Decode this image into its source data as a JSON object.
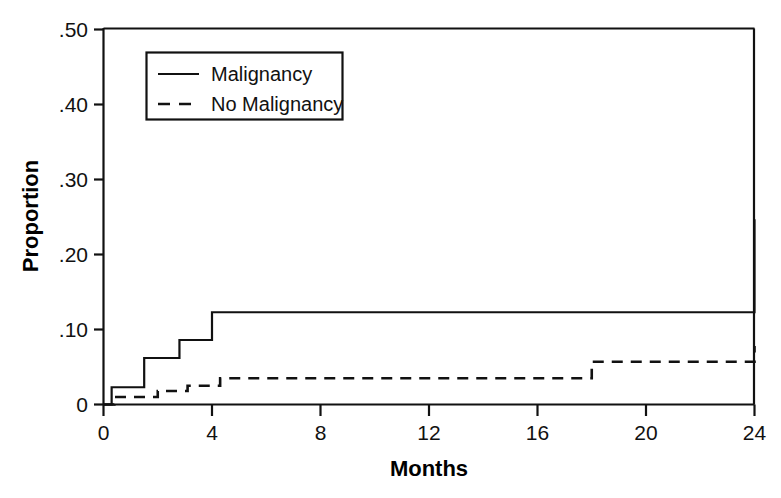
{
  "chart_data": {
    "type": "line",
    "title": "",
    "subtitle": "",
    "xlabel": "Months",
    "ylabel": "Proportion",
    "xlim": [
      0,
      24
    ],
    "ylim": [
      0,
      0.5
    ],
    "grid": false,
    "legend_position": "top-left-inside",
    "x_ticks": [
      0,
      4,
      8,
      12,
      16,
      20,
      24
    ],
    "x_tick_labels": [
      "0",
      "4",
      "8",
      "12",
      "16",
      "20",
      "24"
    ],
    "y_ticks": [
      0,
      0.1,
      0.2,
      0.3,
      0.4,
      0.5
    ],
    "y_tick_labels": [
      "0",
      ".10",
      ".20",
      ".30",
      ".40",
      ".50"
    ],
    "interpolation": "step-after",
    "series": [
      {
        "name": "Malignancy",
        "style": "solid",
        "color": "#111111",
        "x": [
          0,
          0.3,
          1.5,
          2.8,
          4.0,
          21.3,
          24
        ],
        "y": [
          0.0,
          0.023,
          0.062,
          0.086,
          0.123,
          0.123,
          0.247
        ]
      },
      {
        "name": "No Malignancy",
        "style": "dashed",
        "color": "#111111",
        "x": [
          0,
          0.4,
          2.0,
          3.1,
          4.3,
          13.5,
          18.0,
          24
        ],
        "y": [
          0.0,
          0.01,
          0.018,
          0.025,
          0.035,
          0.035,
          0.057,
          0.078
        ]
      }
    ],
    "annotations": []
  },
  "legend": {
    "entries": [
      {
        "label": "Malignancy",
        "style": "solid"
      },
      {
        "label": "No Malignancy",
        "style": "dashed"
      }
    ]
  },
  "axes": {
    "x_title": "Months",
    "y_title": "Proportion"
  }
}
